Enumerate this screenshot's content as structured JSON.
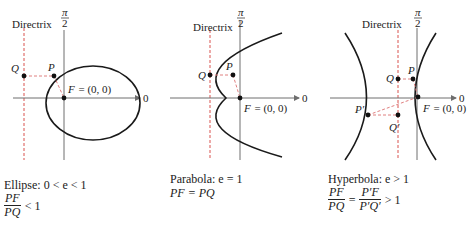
{
  "colors": {
    "curve": "#1a1a1a",
    "axis": "#6e6e6e",
    "directrix": "#d9534f",
    "dashed_segment": "#e08080",
    "point": "#111111"
  },
  "panels": [
    {
      "id": "ellipse",
      "directrix_label": "Directrix",
      "axis_top_label_num": "π",
      "axis_top_label_den": "2",
      "axis_right_label": "0",
      "point_Q": "Q",
      "point_P": "P",
      "focus_label": "F = (0, 0)",
      "caption_line1": "Ellipse:  0 < e < 1",
      "caption_frac_num": "PF",
      "caption_frac_den": "PQ",
      "caption_rel": "< 1"
    },
    {
      "id": "parabola",
      "directrix_label": "Directrix",
      "axis_top_label_num": "π",
      "axis_top_label_den": "2",
      "axis_right_label": "0",
      "point_Q": "Q",
      "point_P": "P",
      "focus_label": "F = (0, 0)",
      "caption_line1": "Parabola:  e = 1",
      "caption_line2": "PF = PQ"
    },
    {
      "id": "hyperbola",
      "directrix_label": "Directrix",
      "axis_top_label_num": "π",
      "axis_top_label_den": "2",
      "axis_right_label": "0",
      "point_Q": "Q",
      "point_P": "P",
      "point_P_prime": "P′",
      "point_Q_prime": "Q′",
      "focus_label": "F = (0, 0)",
      "caption_line1": "Hyperbola:  e > 1",
      "caption_frac1_num": "PF",
      "caption_frac1_den": "PQ",
      "caption_eq": "=",
      "caption_frac2_num": "P′F",
      "caption_frac2_den": "P′Q′",
      "caption_rel": "> 1"
    }
  ]
}
